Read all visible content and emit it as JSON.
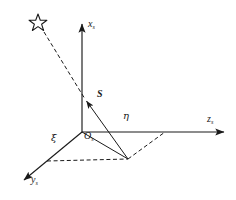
{
  "figure": {
    "name": "sun-sensor-coordinate-frame-diagram",
    "background_color": "#ffffff",
    "line_color": "#1a1a1a",
    "width": 236,
    "height": 200
  },
  "axes": [
    {
      "id": "x-axis",
      "label": "x",
      "subscript": "s",
      "direction": "up",
      "origin": {
        "x": 82,
        "y": 132
      },
      "tip": {
        "x": 82,
        "y": 22
      },
      "label_pos": {
        "x": 88,
        "y": 20
      }
    },
    {
      "id": "y-axis",
      "label": "y",
      "subscript": "s",
      "direction": "down-left",
      "origin": {
        "x": 82,
        "y": 132
      },
      "tip": {
        "x": 22,
        "y": 182
      },
      "label_pos": {
        "x": 30,
        "y": 180
      }
    },
    {
      "id": "z-axis",
      "label": "z",
      "subscript": "s",
      "direction": "right",
      "origin": {
        "x": 82,
        "y": 132
      },
      "tip": {
        "x": 226,
        "y": 132
      },
      "label_pos": {
        "x": 208,
        "y": 119
      }
    }
  ],
  "origin_marker": {
    "id": "origin-label",
    "label": "O",
    "subscript": "s",
    "point": {
      "x": 82,
      "y": 132
    },
    "label_pos": {
      "x": 84,
      "y": 134
    }
  },
  "vector": {
    "id": "sun-vector",
    "label": "S",
    "bold": true,
    "italic": true,
    "tail": {
      "x": 128,
      "y": 159
    },
    "head": {
      "x": 85,
      "y": 99
    },
    "label_pos": {
      "x": 97,
      "y": 94
    },
    "style": "solid-arrow"
  },
  "star": {
    "id": "star-marker",
    "points": 5,
    "center": {
      "x": 38,
      "y": 23
    },
    "radius_outer": 9,
    "radius_inner": 3.9,
    "fill": "none",
    "stroke": "#1a1a1a"
  },
  "sight_line": {
    "id": "line-of-sight",
    "from": {
      "x": 43,
      "y": 31
    },
    "to": {
      "x": 85,
      "y": 99
    },
    "style": "dashed"
  },
  "angles": [
    {
      "id": "angle-xi",
      "symbol": "ξ",
      "name": "xi",
      "label_pos": {
        "x": 53,
        "y": 137
      },
      "between": [
        "y-axis",
        "projection-line"
      ]
    },
    {
      "id": "angle-eta",
      "symbol": "η",
      "name": "eta",
      "label_pos": {
        "x": 124,
        "y": 115
      },
      "between": [
        "z-axis",
        "projection-line"
      ]
    }
  ],
  "projection": {
    "id": "ground-projection",
    "solid_line": {
      "from": {
        "x": 82,
        "y": 132
      },
      "to": {
        "x": 128,
        "y": 159
      }
    },
    "dashed_parallelogram": [
      {
        "x": 82,
        "y": 132
      },
      {
        "x": 47,
        "y": 161
      },
      {
        "x": 128,
        "y": 159
      },
      {
        "x": 165,
        "y": 132
      }
    ],
    "dashed_segments": [
      {
        "from": {
          "x": 47,
          "y": 161
        },
        "to": {
          "x": 128,
          "y": 159
        }
      },
      {
        "from": {
          "x": 128,
          "y": 159
        },
        "to": {
          "x": 165,
          "y": 132
        }
      }
    ]
  }
}
